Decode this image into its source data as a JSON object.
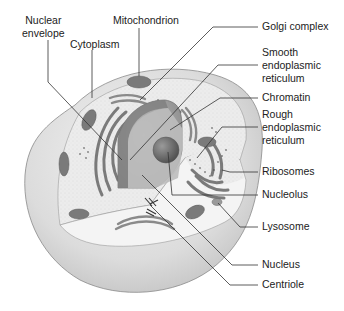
{
  "figure": {
    "labels": {
      "nuclear_envelope": "Nuclear\nenvelope",
      "cytoplasm": "Cytoplasm",
      "mitochondrion": "Mitochondrion",
      "golgi_complex": "Golgi complex",
      "smooth_er": "Smooth\nendoplasmic\nreticulum",
      "chromatin": "Chromatin",
      "rough_er": "Rough\nendoplasmic\nreticulum",
      "ribosomes": "Ribosomes",
      "nucleolus": "Nucleolus",
      "lysosome": "Lysosome",
      "nucleus": "Nucleus",
      "centriole": "Centriole"
    },
    "colors": {
      "membrane_outer": "#d9d9d9",
      "cytoplasm": "#ededed",
      "organelle": "#7a7a7a",
      "nucleus": "#a8a8a8",
      "nucleolus": "#6f6f6f",
      "leader_line": "#333333"
    }
  }
}
